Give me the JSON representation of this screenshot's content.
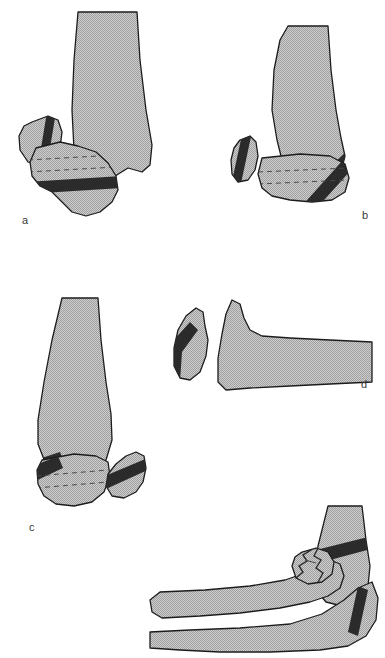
{
  "figure": {
    "background_color": "#ffffff",
    "bone_fill_color": "#b5b5b5",
    "bone_outline_color": "#1c1c1c",
    "fracture_band_color": "#2b2b2b",
    "dashed_line_color": "#4a4a4a",
    "label_color": "#3a3a3a"
  },
  "panels": [
    {
      "id": "a",
      "label": "a",
      "label_x": 22,
      "label_y": 221,
      "description": "Distal humerus with displaced medial epicondyle fragment and transverse fracture band across the trochlea"
    },
    {
      "id": "b",
      "label": "b",
      "label_x": 362,
      "label_y": 216,
      "description": "Distal humerus with separated small medial fragment and oblique dark fracture band on the lateral condyle"
    },
    {
      "id": "c",
      "label": "c",
      "label_x": 29,
      "label_y": 528,
      "description": "Distal humerus with medial fracture band and a detached lateral condylar fragment displaced laterally"
    },
    {
      "id": "d",
      "label": "d",
      "label_x": 361,
      "label_y": 385,
      "description": "Lateral view of a detached condylar fragment separated from the humeral shaft"
    },
    {
      "id": "e",
      "label": "",
      "label_x": 0,
      "label_y": 0,
      "description": "Lateral view of the elbow joint with radius and ulna, comminuted radial head fracture and dark fracture bands in the distal humerus and olecranon"
    }
  ]
}
